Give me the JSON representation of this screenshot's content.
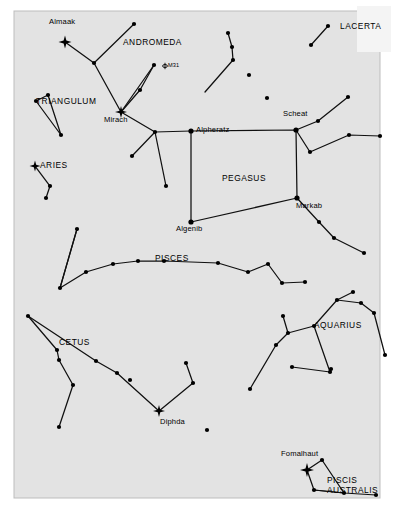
{
  "figure": {
    "kind": "star-chart",
    "background_color": "#e3e3e3",
    "page_color": "#ffffff",
    "ink_color": "#000000",
    "frame": {
      "x": 14,
      "y": 11,
      "width": 366,
      "height": 487
    }
  },
  "chart_data": {
    "type": "scatter",
    "title": "",
    "xlabel": "",
    "ylabel": "",
    "grid": false,
    "legend": "none",
    "xlim": [
      14,
      380
    ],
    "ylim": [
      11,
      498
    ],
    "constellation_labels": [
      {
        "name": "ANDROMEDA",
        "x": 123,
        "y": 45
      },
      {
        "name": "LACERTA",
        "x": 340,
        "y": 29
      },
      {
        "name": "TRIANGULUM",
        "x": 36,
        "y": 104
      },
      {
        "name": "ARIES",
        "x": 40,
        "y": 168
      },
      {
        "name": "PEGASUS",
        "x": 222,
        "y": 181
      },
      {
        "name": "PISCES",
        "x": 155,
        "y": 261
      },
      {
        "name": "CETUS",
        "x": 59,
        "y": 345
      },
      {
        "name": "AQUARIUS",
        "x": 314,
        "y": 328
      },
      {
        "name": "PISCIS",
        "x": 327,
        "y": 483
      },
      {
        "name": "AUSTRALIS",
        "x": 327,
        "y": 492
      }
    ],
    "star_labels": [
      {
        "name": "Almaak",
        "x": 49,
        "y": 24
      },
      {
        "name": "Mirach",
        "x": 104,
        "y": 122
      },
      {
        "name": "Alpheratz",
        "x": 196,
        "y": 132
      },
      {
        "name": "Scheat",
        "x": 283,
        "y": 116
      },
      {
        "name": "Markab",
        "x": 296,
        "y": 208
      },
      {
        "name": "Algenib",
        "x": 176,
        "y": 228
      },
      {
        "name": "Diphda",
        "x": 160,
        "y": 421
      },
      {
        "name": "Fomalhaut",
        "x": 281,
        "y": 456
      }
    ],
    "object_labels": [
      {
        "name": "M31",
        "x": 165,
        "y": 66,
        "symbol": "galaxy"
      }
    ],
    "bright_stars": [
      {
        "name": "Almaak",
        "x": 65,
        "y": 42,
        "size": 6.5
      },
      {
        "name": "Mirach",
        "x": 121,
        "y": 112,
        "size": 6.0
      },
      {
        "name": "Hamal",
        "x": 35,
        "y": 166,
        "size": 5.5
      },
      {
        "name": "Diphda",
        "x": 159,
        "y": 411,
        "size": 6.0
      },
      {
        "name": "Fomalhaut",
        "x": 307,
        "y": 470,
        "size": 7.0
      }
    ],
    "stars": [
      {
        "x": 65,
        "y": 42,
        "mag": 1
      },
      {
        "x": 121,
        "y": 112,
        "mag": 1
      },
      {
        "x": 35,
        "y": 166,
        "mag": 1
      },
      {
        "x": 159,
        "y": 411,
        "mag": 1
      },
      {
        "x": 307,
        "y": 470,
        "mag": 1
      },
      {
        "x": 134,
        "y": 24,
        "mag": 3
      },
      {
        "x": 94,
        "y": 63,
        "mag": 3
      },
      {
        "x": 154,
        "y": 65,
        "mag": 3
      },
      {
        "x": 140,
        "y": 90,
        "mag": 3
      },
      {
        "x": 155,
        "y": 132,
        "mag": 3
      },
      {
        "x": 191,
        "y": 131,
        "mag": 2
      },
      {
        "x": 296,
        "y": 130,
        "mag": 2
      },
      {
        "x": 297,
        "y": 198,
        "mag": 2
      },
      {
        "x": 191,
        "y": 222,
        "mag": 2
      },
      {
        "x": 132,
        "y": 156,
        "mag": 3
      },
      {
        "x": 166,
        "y": 186,
        "mag": 3
      },
      {
        "x": 130,
        "y": 380,
        "mag": 3
      },
      {
        "x": 36,
        "y": 101,
        "mag": 3
      },
      {
        "x": 48,
        "y": 95,
        "mag": 3
      },
      {
        "x": 61,
        "y": 135,
        "mag": 3
      },
      {
        "x": 50,
        "y": 186,
        "mag": 3
      },
      {
        "x": 46,
        "y": 198,
        "mag": 3
      },
      {
        "x": 328,
        "y": 26,
        "mag": 3
      },
      {
        "x": 311,
        "y": 45,
        "mag": 3
      },
      {
        "x": 228,
        "y": 33,
        "mag": 3
      },
      {
        "x": 232,
        "y": 47,
        "mag": 3
      },
      {
        "x": 233,
        "y": 60,
        "mag": 3
      },
      {
        "x": 249,
        "y": 75,
        "mag": 3
      },
      {
        "x": 267,
        "y": 98,
        "mag": 3
      },
      {
        "x": 318,
        "y": 121,
        "mag": 3
      },
      {
        "x": 348,
        "y": 97,
        "mag": 3
      },
      {
        "x": 310,
        "y": 152,
        "mag": 3
      },
      {
        "x": 349,
        "y": 135,
        "mag": 3
      },
      {
        "x": 380,
        "y": 136,
        "mag": 3
      },
      {
        "x": 319,
        "y": 222,
        "mag": 3
      },
      {
        "x": 334,
        "y": 238,
        "mag": 3
      },
      {
        "x": 364,
        "y": 253,
        "mag": 3
      },
      {
        "x": 60,
        "y": 288,
        "mag": 3
      },
      {
        "x": 86,
        "y": 272,
        "mag": 3
      },
      {
        "x": 113,
        "y": 264,
        "mag": 3
      },
      {
        "x": 138,
        "y": 261,
        "mag": 3
      },
      {
        "x": 164,
        "y": 261,
        "mag": 3
      },
      {
        "x": 218,
        "y": 263,
        "mag": 3
      },
      {
        "x": 248,
        "y": 272,
        "mag": 3
      },
      {
        "x": 268,
        "y": 264,
        "mag": 3
      },
      {
        "x": 282,
        "y": 283,
        "mag": 3
      },
      {
        "x": 305,
        "y": 282,
        "mag": 3
      },
      {
        "x": 77,
        "y": 229,
        "mag": 3
      },
      {
        "x": 28,
        "y": 316,
        "mag": 3
      },
      {
        "x": 57,
        "y": 350,
        "mag": 3
      },
      {
        "x": 59,
        "y": 360,
        "mag": 3
      },
      {
        "x": 73,
        "y": 385,
        "mag": 3
      },
      {
        "x": 59,
        "y": 427,
        "mag": 3
      },
      {
        "x": 96,
        "y": 361,
        "mag": 3
      },
      {
        "x": 117,
        "y": 373,
        "mag": 3
      },
      {
        "x": 193,
        "y": 383,
        "mag": 3
      },
      {
        "x": 186,
        "y": 363,
        "mag": 3
      },
      {
        "x": 250,
        "y": 389,
        "mag": 3
      },
      {
        "x": 207,
        "y": 430,
        "mag": 3
      },
      {
        "x": 292,
        "y": 367,
        "mag": 3
      },
      {
        "x": 331,
        "y": 369,
        "mag": 3
      },
      {
        "x": 314,
        "y": 326,
        "mag": 3
      },
      {
        "x": 288,
        "y": 333,
        "mag": 3
      },
      {
        "x": 283,
        "y": 316,
        "mag": 3
      },
      {
        "x": 276,
        "y": 345,
        "mag": 3
      },
      {
        "x": 330,
        "y": 372,
        "mag": 3
      },
      {
        "x": 337,
        "y": 300,
        "mag": 3
      },
      {
        "x": 353,
        "y": 292,
        "mag": 3
      },
      {
        "x": 361,
        "y": 303,
        "mag": 3
      },
      {
        "x": 374,
        "y": 313,
        "mag": 3
      },
      {
        "x": 385,
        "y": 355,
        "mag": 3
      },
      {
        "x": 322,
        "y": 460,
        "mag": 3
      },
      {
        "x": 314,
        "y": 490,
        "mag": 3
      },
      {
        "x": 344,
        "y": 493,
        "mag": 3
      },
      {
        "x": 376,
        "y": 495,
        "mag": 3
      }
    ],
    "constellation_lines": [
      {
        "constellation": "ANDROMEDA",
        "points": [
          [
            134,
            24
          ],
          [
            94,
            63
          ],
          [
            65,
            42
          ]
        ]
      },
      {
        "constellation": "ANDROMEDA",
        "points": [
          [
            94,
            63
          ],
          [
            121,
            112
          ]
        ]
      },
      {
        "constellation": "ANDROMEDA",
        "points": [
          [
            121,
            112
          ],
          [
            154,
            65
          ]
        ]
      },
      {
        "constellation": "ANDROMEDA",
        "points": [
          [
            154,
            65
          ],
          [
            140,
            90
          ],
          [
            121,
            112
          ]
        ]
      },
      {
        "constellation": "ANDROMEDA",
        "points": [
          [
            121,
            112
          ],
          [
            155,
            132
          ],
          [
            191,
            131
          ]
        ]
      },
      {
        "constellation": "ANDROMEDA",
        "points": [
          [
            155,
            132
          ],
          [
            132,
            156
          ]
        ]
      },
      {
        "constellation": "ANDROMEDA",
        "points": [
          [
            155,
            132
          ],
          [
            166,
            186
          ]
        ]
      },
      {
        "constellation": "TRIANGULUM",
        "points": [
          [
            48,
            95
          ],
          [
            36,
            101
          ],
          [
            61,
            135
          ],
          [
            48,
            95
          ]
        ]
      },
      {
        "constellation": "ARIES",
        "points": [
          [
            35,
            166
          ],
          [
            50,
            186
          ],
          [
            46,
            198
          ]
        ]
      },
      {
        "constellation": "LACERTA",
        "points": [
          [
            328,
            26
          ],
          [
            311,
            45
          ]
        ]
      },
      {
        "constellation": "ANDROMEDA-NE",
        "points": [
          [
            228,
            33
          ],
          [
            232,
            47
          ],
          [
            233,
            60
          ],
          [
            205,
            92
          ]
        ]
      },
      {
        "constellation": "PEGASUS",
        "points": [
          [
            191,
            131
          ],
          [
            296,
            130
          ],
          [
            297,
            198
          ],
          [
            191,
            222
          ],
          [
            191,
            131
          ]
        ]
      },
      {
        "constellation": "PEGASUS",
        "points": [
          [
            296,
            130
          ],
          [
            318,
            121
          ],
          [
            348,
            97
          ]
        ]
      },
      {
        "constellation": "PEGASUS",
        "points": [
          [
            296,
            130
          ],
          [
            310,
            152
          ],
          [
            349,
            135
          ],
          [
            380,
            136
          ]
        ]
      },
      {
        "constellation": "PEGASUS",
        "points": [
          [
            297,
            198
          ],
          [
            319,
            222
          ],
          [
            334,
            238
          ],
          [
            364,
            253
          ]
        ]
      },
      {
        "constellation": "PISCES",
        "points": [
          [
            77,
            229
          ],
          [
            60,
            288
          ],
          [
            86,
            272
          ],
          [
            113,
            264
          ],
          [
            138,
            261
          ],
          [
            164,
            261
          ],
          [
            218,
            263
          ],
          [
            248,
            272
          ],
          [
            268,
            264
          ],
          [
            282,
            283
          ],
          [
            305,
            282
          ]
        ]
      },
      {
        "constellation": "PISCES-N",
        "points": [
          [
            60,
            288
          ],
          [
            77,
            229
          ]
        ]
      },
      {
        "constellation": "CETUS",
        "points": [
          [
            28,
            316
          ],
          [
            57,
            350
          ],
          [
            59,
            360
          ],
          [
            73,
            385
          ],
          [
            59,
            427
          ]
        ]
      },
      {
        "constellation": "CETUS",
        "points": [
          [
            28,
            316
          ],
          [
            96,
            361
          ],
          [
            117,
            373
          ],
          [
            159,
            411
          ]
        ]
      },
      {
        "constellation": "CETUS",
        "points": [
          [
            159,
            411
          ],
          [
            193,
            383
          ],
          [
            186,
            363
          ]
        ]
      },
      {
        "constellation": "AQUARIUS",
        "points": [
          [
            283,
            316
          ],
          [
            288,
            333
          ],
          [
            276,
            345
          ],
          [
            250,
            389
          ]
        ]
      },
      {
        "constellation": "AQUARIUS",
        "points": [
          [
            288,
            333
          ],
          [
            314,
            326
          ],
          [
            330,
            372
          ],
          [
            331,
            369
          ]
        ]
      },
      {
        "constellation": "AQUARIUS",
        "points": [
          [
            314,
            326
          ],
          [
            337,
            300
          ],
          [
            353,
            292
          ]
        ]
      },
      {
        "constellation": "AQUARIUS",
        "points": [
          [
            337,
            300
          ],
          [
            361,
            303
          ],
          [
            374,
            313
          ],
          [
            385,
            355
          ]
        ]
      },
      {
        "constellation": "AQUARIUS",
        "points": [
          [
            330,
            372
          ],
          [
            292,
            367
          ]
        ]
      },
      {
        "constellation": "PISCIS AUSTRALIS",
        "points": [
          [
            307,
            470
          ],
          [
            322,
            460
          ],
          [
            344,
            493
          ],
          [
            314,
            490
          ],
          [
            307,
            470
          ]
        ]
      },
      {
        "constellation": "PISCIS AUSTRALIS",
        "points": [
          [
            314,
            490
          ],
          [
            344,
            493
          ],
          [
            376,
            495
          ]
        ]
      }
    ]
  },
  "labels": {
    "almaak": "Almaak",
    "andromeda": "ANDROMEDA",
    "lacerta": "LACERTA",
    "m31": "M31",
    "triangulum": "TRIANGULUM",
    "mirach": "Mirach",
    "alpheratz": "Alpheratz",
    "scheat": "Scheat",
    "aries": "ARIES",
    "pegasus": "PEGASUS",
    "markab": "Markab",
    "algenib": "Algenib",
    "pisces": "PISCES",
    "cetus": "CETUS",
    "aquarius": "AQUARIUS",
    "diphda": "Diphda",
    "fomalhaut": "Fomalhaut",
    "piscis": "PISCIS",
    "australis": "AUSTRALIS"
  }
}
